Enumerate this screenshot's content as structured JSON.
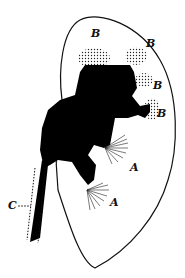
{
  "figure": {
    "labels": {
      "b1": "B",
      "b2": "B",
      "b3": "B",
      "b4": "B",
      "a1": "A",
      "a2": "A",
      "c": "C"
    },
    "colors": {
      "fill": "#000000",
      "outline": "#111111",
      "background": "#ffffff"
    }
  }
}
